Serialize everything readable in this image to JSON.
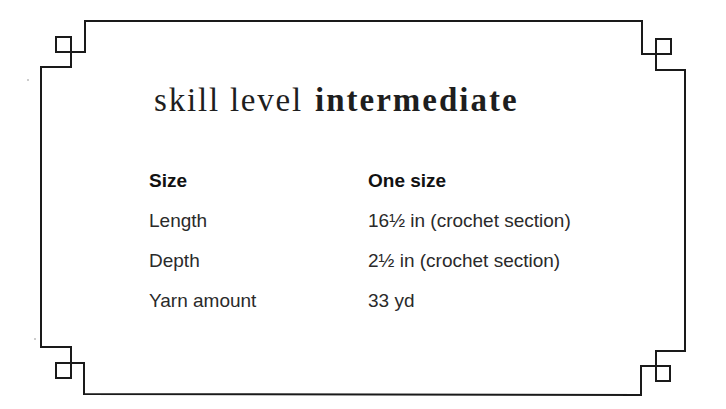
{
  "skill": {
    "label": "skill level",
    "value": "intermediate"
  },
  "specs": {
    "header": {
      "key": "Size",
      "value": "One size"
    },
    "rows": [
      {
        "key": "Length",
        "value": "16½ in (crochet section)"
      },
      {
        "key": "Depth",
        "value": "2½ in (crochet section)"
      },
      {
        "key": "Yarn amount",
        "value": "33 yd"
      }
    ]
  },
  "colors": {
    "border": "#1a1a1a",
    "text": "#222222",
    "background": "#ffffff"
  }
}
